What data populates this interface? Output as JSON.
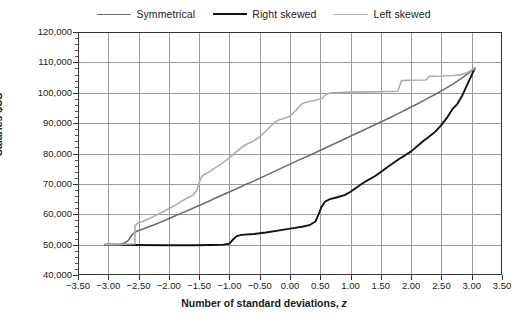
{
  "chart_data": {
    "type": "line",
    "title": "",
    "xlabel": "Number of standard deviations, z",
    "ylabel": "Salaries $US",
    "xlim": [
      -3.5,
      3.5
    ],
    "ylim": [
      40000,
      120000
    ],
    "xticks": [
      "-3.50",
      "-3.00",
      "-2.50",
      "-2.00",
      "-1.50",
      "-1.00",
      "-0.50",
      "0.00",
      "0.50",
      "1.00",
      "1.50",
      "2.00",
      "2.50",
      "3.00",
      "3.50"
    ],
    "xtick_values": [
      -3.5,
      -3.0,
      -2.5,
      -2.0,
      -1.5,
      -1.0,
      -0.5,
      0.0,
      0.5,
      1.0,
      1.5,
      2.0,
      2.5,
      3.0,
      3.5
    ],
    "yticks": [
      "40,000",
      "50,000",
      "60,000",
      "70,000",
      "80,000",
      "90,000",
      "100,000",
      "110,000",
      "120,000"
    ],
    "ytick_values": [
      40000,
      50000,
      60000,
      70000,
      80000,
      90000,
      100000,
      110000,
      120000
    ],
    "y_minor_step": 2000,
    "grid": "both",
    "legend_position": "top-center",
    "series": [
      {
        "name": "Symmetrical",
        "color": "#6e6e6e",
        "width": 1.6,
        "points": [
          [
            -3.05,
            50000
          ],
          [
            -2.9,
            50000
          ],
          [
            -2.8,
            50100
          ],
          [
            -2.72,
            50600
          ],
          [
            -2.66,
            51600
          ],
          [
            -2.6,
            53400
          ],
          [
            -2.54,
            54300
          ],
          [
            -2.46,
            54900
          ],
          [
            -2.35,
            55700
          ],
          [
            -2.2,
            56900
          ],
          [
            -2.05,
            58100
          ],
          [
            -1.9,
            59400
          ],
          [
            -1.75,
            60700
          ],
          [
            -1.62,
            61800
          ],
          [
            -1.5,
            62900
          ],
          [
            -1.35,
            64200
          ],
          [
            -1.2,
            65600
          ],
          [
            -1.05,
            66900
          ],
          [
            -0.9,
            68200
          ],
          [
            -0.75,
            69600
          ],
          [
            -0.6,
            70900
          ],
          [
            -0.45,
            72300
          ],
          [
            -0.3,
            73700
          ],
          [
            -0.15,
            75100
          ],
          [
            0.0,
            76500
          ],
          [
            0.15,
            77900
          ],
          [
            0.3,
            79200
          ],
          [
            0.45,
            80600
          ],
          [
            0.6,
            82000
          ],
          [
            0.75,
            83400
          ],
          [
            0.9,
            84800
          ],
          [
            1.05,
            86200
          ],
          [
            1.2,
            87600
          ],
          [
            1.35,
            89000
          ],
          [
            1.5,
            90400
          ],
          [
            1.65,
            91800
          ],
          [
            1.8,
            93300
          ],
          [
            1.95,
            94800
          ],
          [
            2.1,
            96300
          ],
          [
            2.25,
            97900
          ],
          [
            2.4,
            99500
          ],
          [
            2.55,
            101200
          ],
          [
            2.7,
            103000
          ],
          [
            2.85,
            105000
          ],
          [
            2.95,
            106500
          ],
          [
            3.05,
            108000
          ]
        ]
      },
      {
        "name": "Right skewed",
        "color": "#121212",
        "width": 1.9,
        "points": [
          [
            -3.05,
            50000
          ],
          [
            -2.6,
            49900
          ],
          [
            -2.0,
            49800
          ],
          [
            -1.6,
            49800
          ],
          [
            -1.3,
            49900
          ],
          [
            -1.1,
            50000
          ],
          [
            -1.0,
            50300
          ],
          [
            -0.95,
            51500
          ],
          [
            -0.88,
            52800
          ],
          [
            -0.8,
            53200
          ],
          [
            -0.6,
            53500
          ],
          [
            -0.4,
            54000
          ],
          [
            -0.2,
            54600
          ],
          [
            -0.05,
            55100
          ],
          [
            0.08,
            55500
          ],
          [
            0.2,
            55900
          ],
          [
            0.32,
            56400
          ],
          [
            0.42,
            57600
          ],
          [
            0.47,
            59900
          ],
          [
            0.52,
            62400
          ],
          [
            0.58,
            64200
          ],
          [
            0.66,
            65000
          ],
          [
            0.78,
            65600
          ],
          [
            0.9,
            66300
          ],
          [
            1.0,
            67400
          ],
          [
            1.1,
            68800
          ],
          [
            1.2,
            70200
          ],
          [
            1.3,
            71400
          ],
          [
            1.4,
            72500
          ],
          [
            1.5,
            73900
          ],
          [
            1.6,
            75400
          ],
          [
            1.7,
            76800
          ],
          [
            1.8,
            78200
          ],
          [
            1.9,
            79400
          ],
          [
            2.0,
            80700
          ],
          [
            2.1,
            82400
          ],
          [
            2.2,
            84100
          ],
          [
            2.3,
            85600
          ],
          [
            2.4,
            87200
          ],
          [
            2.5,
            89400
          ],
          [
            2.6,
            92000
          ],
          [
            2.68,
            94600
          ],
          [
            2.76,
            96200
          ],
          [
            2.84,
            98900
          ],
          [
            2.92,
            102400
          ],
          [
            2.98,
            105000
          ],
          [
            3.05,
            108000
          ]
        ]
      },
      {
        "name": "Left skewed",
        "color": "#adadad",
        "width": 1.6,
        "points": [
          [
            -3.05,
            50000
          ],
          [
            -2.85,
            50000
          ],
          [
            -2.72,
            50100
          ],
          [
            -2.62,
            50200
          ],
          [
            -2.56,
            50200
          ],
          [
            -2.56,
            56200
          ],
          [
            -2.52,
            57000
          ],
          [
            -2.44,
            57600
          ],
          [
            -2.34,
            58400
          ],
          [
            -2.2,
            59800
          ],
          [
            -2.05,
            61300
          ],
          [
            -1.9,
            62900
          ],
          [
            -1.78,
            64400
          ],
          [
            -1.68,
            65500
          ],
          [
            -1.6,
            66300
          ],
          [
            -1.54,
            67800
          ],
          [
            -1.5,
            70400
          ],
          [
            -1.46,
            72400
          ],
          [
            -1.42,
            73000
          ],
          [
            -1.35,
            73800
          ],
          [
            -1.25,
            75100
          ],
          [
            -1.14,
            76500
          ],
          [
            -1.05,
            77800
          ],
          [
            -0.95,
            79400
          ],
          [
            -0.86,
            81000
          ],
          [
            -0.78,
            82300
          ],
          [
            -0.7,
            83200
          ],
          [
            -0.62,
            83900
          ],
          [
            -0.52,
            85200
          ],
          [
            -0.42,
            87000
          ],
          [
            -0.33,
            88800
          ],
          [
            -0.25,
            90200
          ],
          [
            -0.18,
            91100
          ],
          [
            -0.1,
            91500
          ],
          [
            -0.02,
            92100
          ],
          [
            0.06,
            93400
          ],
          [
            0.14,
            95100
          ],
          [
            0.2,
            96400
          ],
          [
            0.26,
            96900
          ],
          [
            0.36,
            97300
          ],
          [
            0.44,
            97600
          ],
          [
            0.52,
            98100
          ],
          [
            0.6,
            99500
          ],
          [
            0.68,
            100000
          ],
          [
            0.8,
            100100
          ],
          [
            1.0,
            100200
          ],
          [
            1.3,
            100300
          ],
          [
            1.6,
            100400
          ],
          [
            1.78,
            100500
          ],
          [
            1.84,
            104000
          ],
          [
            1.98,
            104100
          ],
          [
            2.24,
            104200
          ],
          [
            2.3,
            105400
          ],
          [
            2.5,
            105500
          ],
          [
            2.7,
            105700
          ],
          [
            2.82,
            105900
          ],
          [
            2.92,
            106600
          ],
          [
            3.05,
            108000
          ]
        ]
      }
    ]
  },
  "legend": {
    "items": [
      {
        "label": "Symmetrical",
        "color": "#6e6e6e",
        "width": 1.6
      },
      {
        "label": "Right skewed",
        "color": "#121212",
        "width": 2.4
      },
      {
        "label": "Left skewed",
        "color": "#adadad",
        "width": 1.6
      }
    ]
  },
  "axis_titles": {
    "x_main": "Number of standard deviations,",
    "x_italic": "z",
    "y": "Salaries $US"
  }
}
